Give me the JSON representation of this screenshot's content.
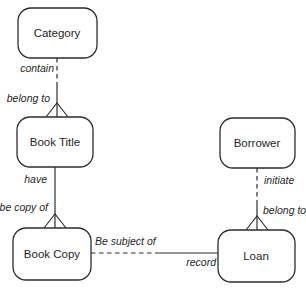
{
  "diagram": {
    "type": "entity-relationship",
    "domain_subject": "library loans",
    "entities": [
      {
        "label": "Category"
      },
      {
        "label": "Book Title"
      },
      {
        "label": "Book Copy"
      },
      {
        "label": "Borrower"
      },
      {
        "label": "Loan"
      }
    ],
    "relationships": [
      {
        "from": "Category",
        "to": "Book Title",
        "source_label": "contain",
        "target_label": "belong to",
        "line_style": "dashed-then-solid",
        "target_end": "crow-foot"
      },
      {
        "from": "Book Title",
        "to": "Book Copy",
        "source_label": "have",
        "target_label": "be copy of",
        "line_style": "solid",
        "target_end": "crow-foot"
      },
      {
        "from": "Borrower",
        "to": "Loan",
        "source_label": "initiate",
        "target_label": "belong to",
        "line_style": "dashed-then-solid",
        "target_end": "crow-foot"
      },
      {
        "from": "Book Copy",
        "to": "Loan",
        "source_label": "Be subject of",
        "target_label": "record",
        "line_style": "dashed-then-solid",
        "target_end": "plain"
      }
    ],
    "colors": {
      "stroke": "#2d2d2d",
      "text": "#1f1f1f",
      "background": "#ffffff"
    }
  }
}
